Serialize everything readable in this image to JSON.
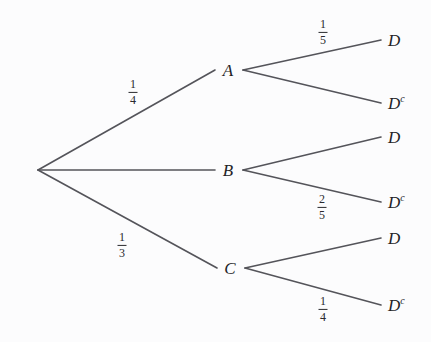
{
  "diagram": {
    "type": "probability-tree",
    "background_color": "#fcfcfd",
    "line_color": "#54545a",
    "text_color": "#232326",
    "root": {
      "label": "",
      "x": 38,
      "y": 170
    },
    "level1_nodes": [
      {
        "id": "A",
        "label": "A",
        "x": 228,
        "y": 70,
        "probability": {
          "numerator": "1",
          "denominator": "4"
        }
      },
      {
        "id": "B",
        "label": "B",
        "x": 228,
        "y": 170,
        "probability": {
          "numerator": "",
          "denominator": ""
        }
      },
      {
        "id": "C",
        "label": "C",
        "x": 230,
        "y": 268,
        "probability": {
          "numerator": "1",
          "denominator": "3"
        }
      }
    ],
    "leaves": [
      {
        "id": "A-D",
        "parent": "A",
        "base": "D",
        "superscript": "",
        "x": 394,
        "y": 40,
        "probability": {
          "numerator": "1",
          "denominator": "5"
        }
      },
      {
        "id": "A-Dc",
        "parent": "A",
        "base": "D",
        "superscript": "c",
        "x": 394,
        "y": 103,
        "probability": {
          "numerator": "",
          "denominator": ""
        }
      },
      {
        "id": "B-D",
        "parent": "B",
        "base": "D",
        "superscript": "",
        "x": 394,
        "y": 137,
        "probability": {
          "numerator": "",
          "denominator": ""
        }
      },
      {
        "id": "B-Dc",
        "parent": "B",
        "base": "D",
        "superscript": "c",
        "x": 394,
        "y": 202,
        "probability": {
          "numerator": "2",
          "denominator": "5"
        }
      },
      {
        "id": "C-D",
        "parent": "C",
        "base": "D",
        "superscript": "",
        "x": 394,
        "y": 238,
        "probability": {
          "numerator": "",
          "denominator": ""
        }
      },
      {
        "id": "C-Dc",
        "parent": "C",
        "base": "D",
        "superscript": "c",
        "x": 394,
        "y": 305,
        "probability": {
          "numerator": "1",
          "denominator": "4"
        }
      }
    ],
    "edge_labels": [
      {
        "id": "root-A",
        "numerator": "1",
        "denominator": "4",
        "x": 133,
        "y": 92
      },
      {
        "id": "root-C",
        "numerator": "1",
        "denominator": "3",
        "x": 122,
        "y": 245
      },
      {
        "id": "A-D",
        "numerator": "1",
        "denominator": "5",
        "x": 323,
        "y": 32
      },
      {
        "id": "B-Dc",
        "numerator": "2",
        "denominator": "5",
        "x": 322,
        "y": 207
      },
      {
        "id": "C-Dc",
        "numerator": "1",
        "denominator": "4",
        "x": 323,
        "y": 309
      }
    ]
  }
}
